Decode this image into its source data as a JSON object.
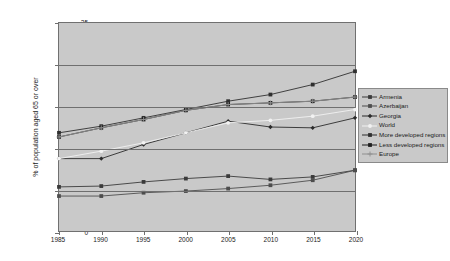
{
  "chart_data": {
    "type": "line",
    "title": "",
    "xlabel": "",
    "ylabel": "% of population aged 65 or over",
    "x": [
      1985,
      1990,
      1995,
      2000,
      2005,
      2010,
      2015,
      2020
    ],
    "xtick_labels": [
      "1985",
      "1990",
      "1995",
      "2000",
      "2005",
      "2010",
      "2015",
      "2020"
    ],
    "ytick_labels": [
      "0",
      "5",
      "10",
      "15",
      "20",
      "25"
    ],
    "yticks": [
      0,
      5,
      10,
      15,
      20,
      25
    ],
    "ylim": [
      0,
      25
    ],
    "xlim": [
      1985,
      2020
    ],
    "grid": "horizontal",
    "legend_position": "right",
    "series": [
      {
        "name": "Armenia",
        "color": "#3a3a3a",
        "marker": "square",
        "values": [
          5.3,
          5.4,
          5.9,
          6.3,
          6.6,
          6.2,
          6.5,
          7.3
        ]
      },
      {
        "name": "Azerbaijan",
        "color": "#4d4d4d",
        "marker": "square",
        "values": [
          4.2,
          4.2,
          4.6,
          4.8,
          5.1,
          5.5,
          6.1,
          7.3
        ]
      },
      {
        "name": "Georgia",
        "color": "#2b2b2b",
        "marker": "diamond",
        "values": [
          8.7,
          8.7,
          10.4,
          11.8,
          13.2,
          12.5,
          12.4,
          13.6
        ]
      },
      {
        "name": "World",
        "color": "#f2f2f2",
        "marker": "circle",
        "values": [
          8.7,
          9.6,
          10.6,
          11.8,
          13.0,
          13.3,
          13.8,
          14.6
        ]
      },
      {
        "name": "More developed regions",
        "color": "#2f2f2f",
        "marker": "square",
        "values": [
          11.8,
          12.6,
          13.6,
          14.6,
          15.6,
          16.4,
          17.6,
          19.2
        ]
      },
      {
        "name": "Less developed regions",
        "color": "#1f1f1f",
        "marker": "square",
        "values": [
          11.3,
          12.4,
          13.4,
          14.5,
          15.2,
          15.4,
          15.6,
          16.1
        ]
      },
      {
        "name": "Europe",
        "color": "#8f8f8f",
        "marker": "plus",
        "values": [
          11.3,
          12.4,
          13.4,
          14.5,
          15.2,
          15.4,
          15.6,
          16.1
        ]
      }
    ]
  }
}
